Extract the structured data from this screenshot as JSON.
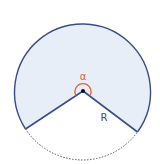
{
  "diagram": {
    "type": "circular-sector",
    "angle_label": "α",
    "radius_label": "R",
    "colors": {
      "fill": "#e8eef8",
      "outline": "#3a4e86",
      "angle_arc": "#e0623e",
      "dashed_arc": "#555555",
      "center_dot": "#111111",
      "label": "#3a4e86"
    }
  }
}
